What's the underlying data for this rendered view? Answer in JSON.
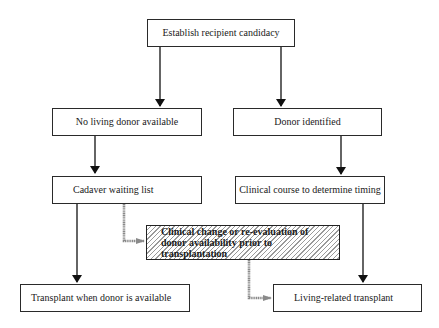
{
  "diagram": {
    "type": "flowchart",
    "nodes": {
      "establish": {
        "label": "Establish recipient candidacy"
      },
      "no_living_donor": {
        "label": "No living donor available"
      },
      "donor_identified": {
        "label": "Donor identified"
      },
      "cadaver_list": {
        "label": "Cadaver waiting list"
      },
      "clinical_course": {
        "label": "Clinical course to determine timing"
      },
      "clinical_change": {
        "label": "Clinical change or re-evaluation of donor availability prior to transplantation"
      },
      "transplant_when_available": {
        "label": "Transplant when donor is available"
      },
      "living_related": {
        "label": "Living-related transplant"
      }
    },
    "edges": [
      {
        "from": "Establish recipient candidacy",
        "to": "No living donor available",
        "style": "solid-arrow"
      },
      {
        "from": "Establish recipient candidacy",
        "to": "Donor identified",
        "style": "solid-arrow"
      },
      {
        "from": "No living donor available",
        "to": "Cadaver waiting list",
        "style": "solid-arrow"
      },
      {
        "from": "Donor identified",
        "to": "Clinical course to determine timing",
        "style": "solid-arrow"
      },
      {
        "from": "Cadaver waiting list",
        "to": "Transplant when donor is available",
        "style": "solid-arrow"
      },
      {
        "from": "Clinical course to determine timing",
        "to": "Living-related transplant",
        "style": "solid-arrow"
      },
      {
        "from": "Cadaver waiting list",
        "to": "Clinical change or re-evaluation of donor availability prior to transplantation",
        "style": "hatched-gray-arrow"
      },
      {
        "from": "Clinical change or re-evaluation of donor availability prior to transplantation",
        "to": "Living-related transplant",
        "style": "hatched-gray-arrow"
      }
    ],
    "colors": {
      "line": "#1a1a1a",
      "hatched_connector": "#8a8a8a",
      "hatch": "#9a9a9a",
      "background": "#ffffff"
    }
  }
}
